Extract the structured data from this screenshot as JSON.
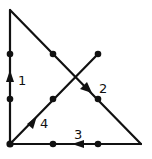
{
  "diagram": {
    "stroke_color": "#111111",
    "background": "#ffffff",
    "dots": [
      {
        "x": 10,
        "y": 54
      },
      {
        "x": 53,
        "y": 54
      },
      {
        "x": 98,
        "y": 54
      },
      {
        "x": 10,
        "y": 99
      },
      {
        "x": 53,
        "y": 99
      },
      {
        "x": 98,
        "y": 99
      },
      {
        "x": 10,
        "y": 144
      },
      {
        "x": 53,
        "y": 144
      },
      {
        "x": 98,
        "y": 144
      }
    ],
    "lines": [
      {
        "label": "1",
        "from": [
          10,
          144
        ],
        "to": [
          10,
          10
        ],
        "direction": "up"
      },
      {
        "label": "2",
        "from": [
          10,
          10
        ],
        "to": [
          141,
          144
        ],
        "direction": "down-right"
      },
      {
        "label": "3",
        "from": [
          141,
          144
        ],
        "to": [
          10,
          144
        ],
        "direction": "left"
      },
      {
        "label": "4",
        "from": [
          10,
          144
        ],
        "to": [
          98,
          54
        ],
        "direction": "up-right"
      }
    ],
    "labels": {
      "l1": "1",
      "l2": "2",
      "l3": "3",
      "l4": "4"
    }
  }
}
